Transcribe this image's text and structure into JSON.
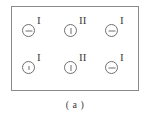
{
  "figure": {
    "caption": "( a )",
    "panel": {
      "border_color": "#8a8a8a",
      "background_color": "#ffffff"
    },
    "symbol_color": "#6f6f6f",
    "text_color": "#3b3b3b",
    "rows": [
      {
        "name": "top-row",
        "cells": [
          {
            "label": "I",
            "mark": "horizontal-dash"
          },
          {
            "label": "II",
            "mark": "vertical-tick"
          },
          {
            "label": "I",
            "mark": "horizontal-dash"
          }
        ]
      },
      {
        "name": "bottom-row",
        "cells": [
          {
            "label": "I",
            "mark": "short-vertical-tick"
          },
          {
            "label": "II",
            "mark": "vertical-tick"
          },
          {
            "label": "I",
            "mark": "horizontal-dash"
          }
        ]
      }
    ]
  }
}
